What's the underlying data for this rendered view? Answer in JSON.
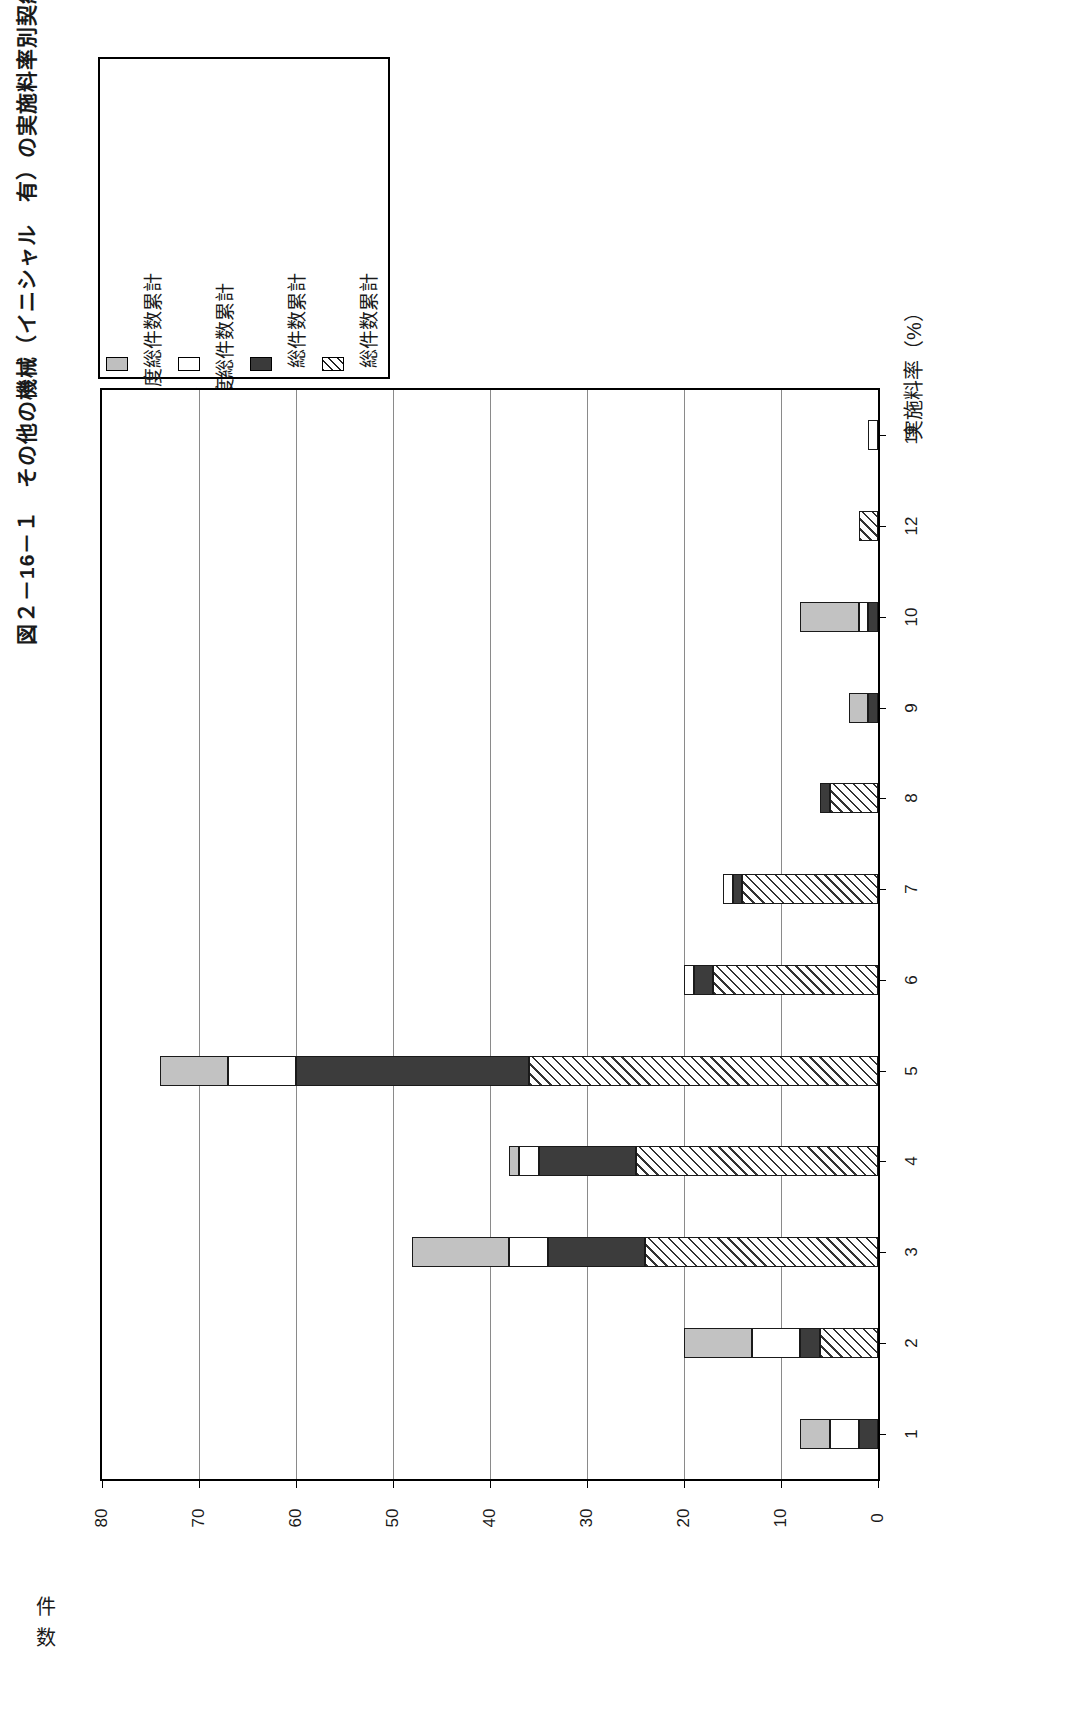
{
  "figure": {
    "title": "図２－16－１　その他の機械（イニシャル　有）の実施料率別契約件数",
    "value_axis_title": "件数",
    "category_axis_title": "実施料率（%）"
  },
  "legend": {
    "items": [
      {
        "label": "平成4年度",
        "swatch": "sw-gray",
        "icon": "gray-square-icon"
      },
      {
        "label": "～平成10年度総件数累計",
        "swatch": "",
        "icon": "no-swatch-icon"
      },
      {
        "label": "昭和63年度",
        "swatch": "sw-white",
        "icon": "white-square-icon"
      },
      {
        "label": "～平成3年度総件数累計",
        "swatch": "",
        "icon": "no-swatch-icon"
      },
      {
        "label": "昭和49年",
        "swatch": "sw-dark",
        "icon": "dark-square-icon"
      },
      {
        "label": "～昭和52年　総件数累計",
        "swatch": "",
        "icon": "no-swatch-icon"
      },
      {
        "label": "昭和43年",
        "swatch": "sw-hatch",
        "icon": "hatched-square-icon"
      },
      {
        "label": "～昭和48年　総件数累計",
        "swatch": "",
        "icon": "no-swatch-icon"
      }
    ]
  },
  "chart_data": {
    "type": "bar",
    "orientation": "horizontal",
    "stacked": true,
    "title": "図２－16－１　その他の機械（イニシャル　有）の実施料率別契約件数",
    "xlabel": "実施料率（%）",
    "ylabel": "件数",
    "categories": [
      "1",
      "2",
      "3",
      "4",
      "5",
      "6",
      "7",
      "8",
      "9",
      "10",
      "12",
      "19"
    ],
    "ylim": [
      0,
      80
    ],
    "yticks": [
      80,
      70,
      60,
      50,
      40,
      30,
      20,
      10,
      0
    ],
    "grid": true,
    "legend_position": "top-left",
    "series": [
      {
        "name": "昭和43年～昭和48年　総件数累計",
        "fill": "f-hatch",
        "values": [
          0,
          6,
          24,
          25,
          36,
          17,
          14,
          5,
          0,
          0,
          2,
          0
        ]
      },
      {
        "name": "昭和49年～昭和52年　総件数累計",
        "fill": "f-dark",
        "values": [
          2,
          2,
          10,
          10,
          24,
          2,
          1,
          1,
          1,
          1,
          0,
          0
        ]
      },
      {
        "name": "昭和63年度～平成3年度総件数累計",
        "fill": "f-white",
        "values": [
          3,
          5,
          4,
          2,
          7,
          1,
          1,
          0,
          0,
          1,
          0,
          1
        ]
      },
      {
        "name": "平成4年度～平成10年度総件数累計",
        "fill": "f-gray",
        "values": [
          3,
          7,
          10,
          1,
          7,
          0,
          0,
          0,
          2,
          6,
          0,
          0
        ]
      }
    ]
  }
}
